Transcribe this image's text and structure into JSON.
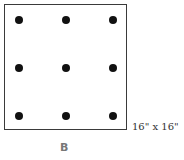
{
  "diagram": {
    "size_label": "16\" x 16\"",
    "figure_label": "B",
    "caption_partial": "",
    "grid": {
      "rows": 3,
      "cols": 3
    },
    "dots": [
      {
        "x": 19,
        "y": 20
      },
      {
        "x": 66,
        "y": 20
      },
      {
        "x": 113,
        "y": 20
      },
      {
        "x": 19,
        "y": 68
      },
      {
        "x": 66,
        "y": 68
      },
      {
        "x": 113,
        "y": 68
      },
      {
        "x": 19,
        "y": 116
      },
      {
        "x": 66,
        "y": 116
      },
      {
        "x": 113,
        "y": 116
      }
    ],
    "colors": {
      "border": "#3a3a3a",
      "dot": "#111111",
      "label": "#777777"
    }
  }
}
